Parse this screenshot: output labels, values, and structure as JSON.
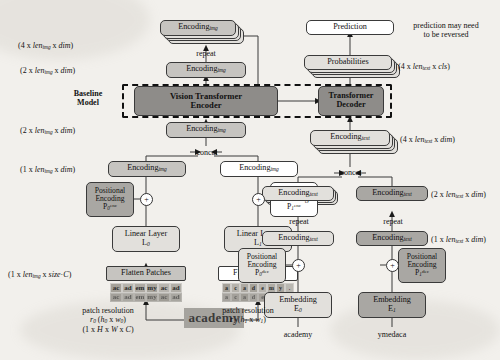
{
  "figure": {
    "type": "architecture-diagram"
  },
  "colors": {
    "page_background": "#f2f0ec",
    "node_light": "#e2e0dc",
    "node_mid": "#c6c4c0",
    "node_dark": "#a9a7a3",
    "node_darker": "#8e8c89",
    "stroke": "#3a3a3a",
    "dashed_border": "#111111"
  },
  "baseline_group": {
    "label_line1": "Baseline",
    "label_line2": "Model"
  },
  "encoder_branch": {
    "core_label_line1": "Vision Transformer",
    "core_label_line2": "Encoder",
    "top_stack_label": "Encoding",
    "top_stack_sub": "img",
    "top_stack_dim": "(4 x len",
    "repeat_label": "repeat",
    "concat_label": "concat",
    "nodes": {
      "encoding_img_repeat_out": "Encoding",
      "encoding_img_pre_encoder": "Encoding",
      "encoding_img_post_encoder": "Encoding",
      "encoding_img_left": "Encoding",
      "encoding_img_right": "Encoding",
      "sub": "img"
    },
    "dims": {
      "four_len_img_dim": "(4 x len_img x dim)",
      "two_len_img_dim_top": "(2 x len_img x dim)",
      "two_len_img_dim_bottom": "(2 x len_img x dim)",
      "one_len_img_dim": "(1 x len_img x dim)",
      "one_len_img_sizeC": "(1 x len_img x size·C)"
    },
    "branch0": {
      "positional_encoding_line1": "Positional",
      "positional_encoding_line2": "Encoding",
      "positional_encoding_symbol": "P",
      "positional_encoding_sub": "0",
      "positional_encoding_sup": "enc",
      "linear_layer_line1": "Linear Layer",
      "linear_layer_symbol": "L",
      "linear_layer_sub": "0",
      "flatten_patches": "Flatten Patches",
      "patch_resolution_label": "patch resolution",
      "patch_resolution_symbol": "r",
      "patch_resolution_sub": "0",
      "patch_resolution_dims": "(h0 x w0)",
      "input_dims": "(1 x H x W x C)",
      "patch_cols": 6,
      "patch_rows": 2,
      "patch_glyphs": [
        "ac",
        "ad",
        "em",
        "my",
        "ac",
        "ad"
      ]
    },
    "branch1": {
      "positional_encoding_line1": "Positional",
      "positional_encoding_line2": "Encoding",
      "positional_encoding_symbol": "P",
      "positional_encoding_sub": "1",
      "positional_encoding_sup": "enc",
      "linear_layer_line1": "Linear Layer",
      "linear_layer_symbol": "L",
      "linear_layer_sub": "1",
      "flatten_patches": "Flatten Patches",
      "patch_resolution_label": "patch resolution",
      "patch_resolution_symbol": "r",
      "patch_resolution_sub": "1",
      "patch_resolution_dims": "(h1 x w1)",
      "patch_cols": 8,
      "patch_rows": 2,
      "patch_glyphs": [
        "a",
        "c",
        "a",
        "d",
        "e",
        "m",
        "y",
        "."
      ]
    },
    "source_image_text": "academy"
  },
  "decoder_branch": {
    "core_label_line1": "Transformer",
    "core_label_line2": "Decoder",
    "prediction_label": "Prediction",
    "probabilities_label": "Probabilities",
    "note_line1": "prediction may need",
    "note_line2": "to be reversed",
    "repeat_label": "repeat",
    "concat_label": "concat",
    "nodes": {
      "encoding_text": "Encoding",
      "sub": "text"
    },
    "dims": {
      "four_len_text_cls": "(4 x len_text x cls)",
      "four_len_text_dim": "(4 x len_text x dim)",
      "two_len_text_dim": "(2 x len_text x dim)",
      "one_len_text_dim": "(1 x len_text x dim)"
    },
    "branch0": {
      "positional_encoding_line1": "Positional",
      "positional_encoding_line2": "Encoding",
      "positional_encoding_symbol": "P",
      "positional_encoding_sub": "0",
      "positional_encoding_sup": "dec",
      "embedding_label": "Embedding",
      "embedding_symbol": "E",
      "embedding_sub": "0",
      "input_text": "academy"
    },
    "branch1": {
      "positional_encoding_line1": "Positional",
      "positional_encoding_line2": "Encoding",
      "positional_encoding_symbol": "P",
      "positional_encoding_sub": "1",
      "positional_encoding_sup": "dec",
      "embedding_label": "Embedding",
      "embedding_symbol": "E",
      "embedding_sub": "1",
      "input_text": "ymedaca"
    }
  }
}
